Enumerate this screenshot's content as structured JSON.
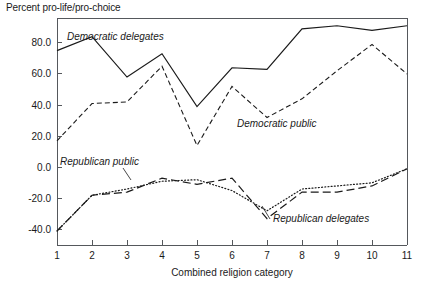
{
  "chart_data": {
    "type": "line",
    "title": "Percent pro-life/pro-choice",
    "xlabel": "Combined religion category",
    "ylabel": "",
    "grid": false,
    "legend_position": "inline-annotations",
    "xlim": [
      1,
      11
    ],
    "ylim": [
      -50,
      96
    ],
    "x": [
      1,
      2,
      3,
      4,
      5,
      6,
      7,
      8,
      9,
      10,
      11
    ],
    "xtick_labels": [
      "1",
      "2",
      "3",
      "4",
      "5",
      "6",
      "7",
      "8",
      "9",
      "10",
      "11"
    ],
    "ytick_values": [
      80,
      60,
      40,
      20,
      0,
      -20,
      -40
    ],
    "ytick_labels": [
      "80.0",
      "60.0",
      "40.0",
      "20.0",
      "0.0",
      "-20.0",
      "-40.0"
    ],
    "series": [
      {
        "name": "Democratic delegates",
        "style": "solid",
        "color": "#1a1a1a",
        "values": [
          75,
          84,
          58,
          73,
          39,
          64,
          63,
          89,
          91,
          88,
          91
        ]
      },
      {
        "name": "Democratic public",
        "style": "dashed",
        "color": "#1a1a1a",
        "values": [
          17,
          41,
          42,
          65,
          14,
          52,
          32,
          44,
          62,
          79,
          60
        ]
      },
      {
        "name": "Republican public",
        "style": "dotted",
        "color": "#1a1a1a",
        "values": [
          -41,
          -18,
          -14,
          -9,
          -8,
          -15,
          -28,
          -14,
          -12,
          -10,
          -1
        ]
      },
      {
        "name": "Republican delegates",
        "style": "longdash",
        "color": "#1a1a1a",
        "values": [
          -41,
          -18,
          -16,
          -7,
          -11,
          -7,
          -33,
          -16,
          -16,
          -12,
          -1
        ]
      }
    ],
    "annotations": [
      {
        "label": "Democratic delegates",
        "x_px": 67,
        "y_px": 40,
        "leader": false
      },
      {
        "label": "Democratic public",
        "x_px": 237,
        "y_px": 127,
        "leader": false
      },
      {
        "label": "Republican public",
        "x_px": 60,
        "y_px": 165,
        "leader": true
      },
      {
        "label": "Republican delegates",
        "x_px": 273,
        "y_px": 222,
        "leader": true
      }
    ]
  },
  "plot_geometry": {
    "left_px": 57,
    "right_px": 407,
    "top_px": 18,
    "bottom_px": 245
  }
}
